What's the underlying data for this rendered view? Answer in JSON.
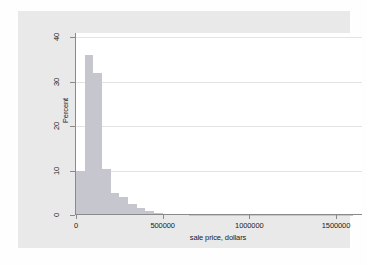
{
  "chart_data": {
    "type": "bar",
    "chart_style": "histogram",
    "title": "",
    "subtitle": "",
    "xlabel": "sale price, dollars",
    "ylabel": "Percent",
    "xlim": [
      0,
      1650000
    ],
    "ylim": [
      0,
      41
    ],
    "grid": "horizontal",
    "legend": "none",
    "bin_width": 50000,
    "bar_color": "#c6c6ce",
    "panel_color": "#ffffff",
    "graph_region_color": "#e9e9e9",
    "xticks": [
      0,
      500000,
      1000000,
      1500000
    ],
    "xtick_labels": [
      "0",
      "500000",
      "1000000",
      "1500000"
    ],
    "yticks": [
      0,
      10,
      20,
      30,
      40
    ],
    "ytick_labels": [
      "0",
      "10",
      "20",
      "30",
      "40"
    ],
    "categories": [
      "0-50000",
      "50000-100000",
      "100000-150000",
      "150000-200000",
      "200000-250000",
      "250000-300000",
      "300000-350000",
      "350000-400000",
      "400000-450000",
      "450000-500000",
      "500000-550000",
      "550000-600000",
      "600000-650000",
      "650000-700000",
      "700000-750000",
      "750000-800000",
      "800000-850000",
      "850000-900000",
      "900000-950000",
      "950000-1000000",
      "1000000-1050000",
      "1050000-1100000",
      "1100000-1150000",
      "1150000-1200000",
      "1200000-1250000",
      "1250000-1300000",
      "1300000-1350000",
      "1350000-1400000",
      "1400000-1450000",
      "1450000-1500000",
      "1500000-1550000",
      "1550000-1600000"
    ],
    "bin_starts": [
      0,
      50000,
      100000,
      150000,
      200000,
      250000,
      300000,
      350000,
      400000,
      450000,
      500000,
      550000,
      600000,
      650000,
      700000,
      750000,
      800000,
      850000,
      900000,
      950000,
      1000000,
      1050000,
      1100000,
      1150000,
      1200000,
      1250000,
      1300000,
      1350000,
      1400000,
      1450000,
      1500000,
      1550000
    ],
    "values": [
      10.0,
      36.0,
      32.0,
      10.3,
      5.0,
      4.0,
      2.5,
      1.5,
      0.8,
      0.35,
      0.2,
      0.15,
      0.12,
      0.1,
      0.1,
      0.08,
      0.07,
      0.06,
      0.05,
      0.05,
      0.05,
      0.04,
      0.04,
      0.03,
      0.03,
      0.03,
      0.02,
      0.02,
      0.02,
      0.02,
      0.02,
      0.02
    ],
    "peak_value": 36.0,
    "peak_bin": "50000-100000"
  },
  "axes": {
    "y_title": "Percent",
    "x_title": "sale price, dollars"
  }
}
